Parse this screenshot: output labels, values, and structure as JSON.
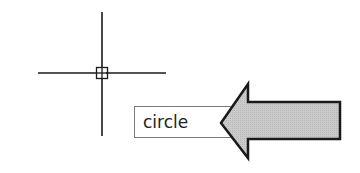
{
  "drawing_area": {
    "background": "#ffffff",
    "crosshair": {
      "center": [
        101,
        73
      ],
      "color": "#1a1a1a",
      "icon": "crosshair-cursor-icon"
    },
    "pickbox": {
      "icon": "pickbox-icon"
    }
  },
  "dynamic_input": {
    "value": "circle"
  },
  "callout_arrow": {
    "icon": "arrow-left-icon",
    "fill": "#c8c8c8",
    "stroke": "#1a1a1a"
  }
}
